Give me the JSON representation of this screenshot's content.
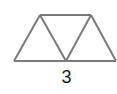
{
  "figure": {
    "triangle_count": 3,
    "label": "3",
    "stroke_color": "#7a7a7a",
    "label_color": "#1a1a1a",
    "vertices": {
      "top_left": [
        40,
        15
      ],
      "top_right": [
        91,
        15
      ],
      "bottom_left": [
        14,
        61
      ],
      "bottom_middle": [
        66,
        61
      ],
      "bottom_right": [
        117,
        61
      ]
    }
  }
}
